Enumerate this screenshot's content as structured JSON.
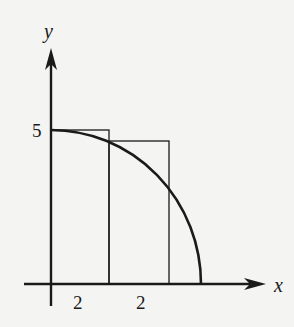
{
  "diagram": {
    "axes": {
      "x_label": "x",
      "y_label": "y"
    },
    "labels": {
      "y_tick": "5",
      "width_1": "2",
      "width_2": "2"
    },
    "colors": {
      "ink": "#1a1a1a",
      "background": "#f4f4f2"
    }
  }
}
